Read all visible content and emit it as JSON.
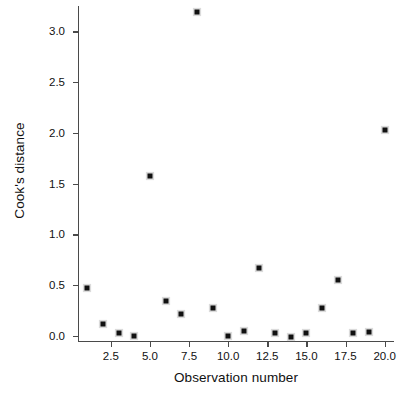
{
  "chart_data": {
    "type": "scatter",
    "title": "",
    "xlabel": "Observation number",
    "ylabel": "Cook's distance",
    "xlim": [
      0.4,
      20.6
    ],
    "ylim": [
      -0.05,
      3.25
    ],
    "grid": false,
    "legend": null,
    "marker": "filled-square",
    "marker_color": "#111111",
    "x": [
      1,
      2,
      3,
      4,
      5,
      6,
      7,
      8,
      9,
      10,
      11,
      12,
      13,
      14,
      15,
      16,
      17,
      18,
      19,
      20
    ],
    "y": [
      0.47,
      0.12,
      0.03,
      0.0,
      1.58,
      0.34,
      0.22,
      3.19,
      0.28,
      0.0,
      0.05,
      0.67,
      0.03,
      -0.01,
      0.03,
      0.28,
      0.55,
      0.03,
      0.04,
      2.03
    ],
    "xticks": [
      2.5,
      5.0,
      7.5,
      10.0,
      12.5,
      15.0,
      17.5,
      20.0
    ],
    "xticklabels": [
      "2.5",
      "5.0",
      "7.5",
      "10.0",
      "12.5",
      "15.0",
      "17.5",
      "20.0"
    ],
    "yticks": [
      0.0,
      0.5,
      1.0,
      1.5,
      2.0,
      2.5,
      3.0
    ],
    "yticklabels": [
      "0.0",
      "0.5",
      "1.0",
      "1.5",
      "2.0",
      "2.5",
      "3.0"
    ],
    "axis_color": "#4a4a4a",
    "background": "#ffffff"
  }
}
